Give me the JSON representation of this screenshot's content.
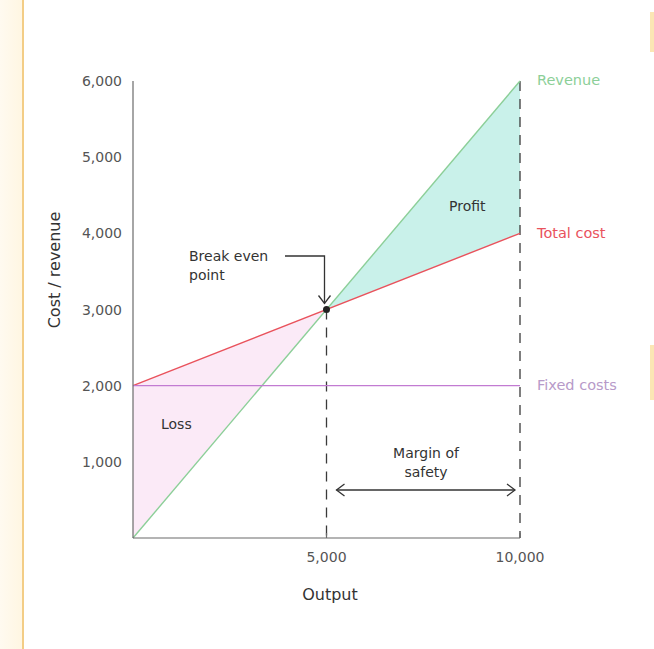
{
  "chart_data": {
    "type": "line",
    "title": "",
    "xlabel": "Output",
    "ylabel": "Cost / revenue",
    "xlim": [
      0,
      10000
    ],
    "ylim": [
      0,
      6000
    ],
    "x_ticks": [
      5000,
      10000
    ],
    "x_tick_labels": [
      "5,000",
      "10,000"
    ],
    "y_ticks": [
      1000,
      2000,
      3000,
      4000,
      5000,
      6000
    ],
    "y_tick_labels": [
      "1,000",
      "2,000",
      "3,000",
      "4,000",
      "5,000",
      "6,000"
    ],
    "grid": false,
    "legend_position": "right-inline",
    "series": [
      {
        "name": "Revenue",
        "x": [
          0,
          10000
        ],
        "y": [
          0,
          6000
        ],
        "color": "#8ccf98"
      },
      {
        "name": "Total cost",
        "x": [
          0,
          10000
        ],
        "y": [
          2000,
          4000
        ],
        "color": "#e9525c"
      },
      {
        "name": "Fixed costs",
        "x": [
          0,
          10000
        ],
        "y": [
          2000,
          2000
        ],
        "color": "#c27bd2"
      }
    ],
    "regions": [
      {
        "name": "Loss",
        "polygon": [
          [
            0,
            2000
          ],
          [
            5000,
            3000
          ],
          [
            0,
            0
          ]
        ],
        "color": "#fbeaf7"
      },
      {
        "name": "Profit",
        "polygon": [
          [
            5000,
            3000
          ],
          [
            10000,
            6000
          ],
          [
            10000,
            4000
          ]
        ],
        "color": "#c9f1ea"
      }
    ],
    "annotations": [
      {
        "text_lines": [
          "Break even",
          "point"
        ],
        "x": 5000,
        "y": 3000,
        "type": "arrow-to-point"
      },
      {
        "text_lines": [
          "Margin of",
          "safety"
        ],
        "from_x": 5000,
        "to_x": 10000,
        "y": 640,
        "type": "double-arrow"
      },
      {
        "text": "Loss",
        "x": 1500,
        "y": 1500
      },
      {
        "text": "Profit",
        "x": 8800,
        "y": 4400
      }
    ],
    "reference_lines": [
      {
        "x": 5000,
        "y_from": 0,
        "y_to": 3000,
        "style": "dashed"
      },
      {
        "x": 10000,
        "y_from": 0,
        "y_to": 6000,
        "style": "dashed"
      }
    ],
    "break_even_point": {
      "x": 5000,
      "y": 3000
    }
  },
  "labels": {
    "ylabel": "Cost / revenue",
    "xlabel": "Output",
    "revenue": "Revenue",
    "total_cost": "Total cost",
    "fixed_costs": "Fixed costs",
    "break_even_1": "Break even",
    "break_even_2": "point",
    "margin_1": "Margin of",
    "margin_2": "safety",
    "loss": "Loss",
    "profit": "Profit"
  },
  "colors": {
    "axis": "#6b6b6b",
    "dash": "#3a3a3a",
    "label_revenue": "#8ccf98",
    "label_total_cost": "#e9525c",
    "label_fixed_costs": "#b79ac9"
  }
}
